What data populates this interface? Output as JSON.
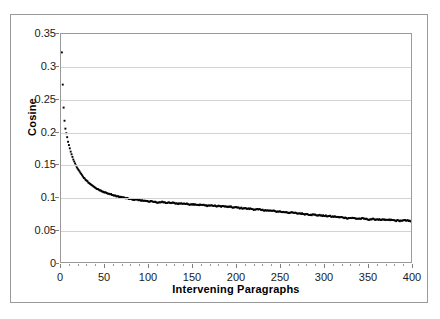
{
  "chart_data": {
    "type": "scatter",
    "title": "",
    "xlabel": "Intervening Paragraphs",
    "ylabel": "Cosine",
    "xlim": [
      0,
      400
    ],
    "ylim": [
      0,
      0.35
    ],
    "xticks": [
      0,
      50,
      100,
      150,
      200,
      250,
      300,
      350,
      400
    ],
    "xtick_labels": [
      "0",
      "50",
      "100",
      "150",
      "200",
      "250",
      "300",
      "350",
      "400"
    ],
    "yticks": [
      0,
      0.05,
      0.1,
      0.15,
      0.2,
      0.25,
      0.3,
      0.35
    ],
    "ytick_labels": [
      "0",
      "0.05",
      "0.1",
      "0.15",
      "0.2",
      "0.25",
      "0.3",
      "0.35"
    ],
    "grid": "horizontal",
    "legend": "none",
    "marker": "small-filled-diamond",
    "marker_color": "#000000",
    "series": [
      {
        "name": "Cosine similarity by intervening paragraph distance",
        "x": [
          1,
          2,
          3,
          4,
          5,
          6,
          7,
          8,
          9,
          10,
          11,
          12,
          13,
          14,
          15,
          16,
          17,
          18,
          19,
          20,
          21,
          22,
          23,
          24,
          25,
          26,
          27,
          28,
          29,
          30,
          31,
          32,
          33,
          34,
          35,
          36,
          37,
          38,
          39,
          40,
          41,
          42,
          43,
          44,
          45,
          46,
          47,
          48,
          49,
          50,
          52,
          54,
          56,
          58,
          60,
          62,
          64,
          66,
          68,
          70,
          72,
          74,
          76,
          78,
          80,
          82,
          84,
          86,
          88,
          90,
          92,
          94,
          96,
          98,
          100,
          104,
          108,
          112,
          116,
          120,
          124,
          128,
          132,
          136,
          140,
          144,
          148,
          152,
          156,
          160,
          164,
          168,
          172,
          176,
          180,
          184,
          188,
          192,
          196,
          200,
          204,
          208,
          212,
          216,
          220,
          224,
          228,
          232,
          236,
          240,
          244,
          248,
          252,
          256,
          260,
          264,
          268,
          272,
          276,
          280,
          284,
          288,
          292,
          296,
          300,
          304,
          308,
          312,
          316,
          320,
          324,
          328,
          332,
          336,
          340,
          344,
          348,
          352,
          356,
          360,
          364,
          368,
          372,
          376,
          380,
          384,
          388,
          392,
          396,
          400
        ],
        "y": [
          0.322,
          0.273,
          0.238,
          0.218,
          0.206,
          0.199,
          0.193,
          0.186,
          0.181,
          0.176,
          0.171,
          0.167,
          0.163,
          0.159,
          0.156,
          0.153,
          0.15,
          0.147,
          0.145,
          0.143,
          0.141,
          0.139,
          0.137,
          0.135,
          0.133,
          0.131,
          0.13,
          0.128,
          0.127,
          0.126,
          0.124,
          0.123,
          0.122,
          0.121,
          0.12,
          0.119,
          0.118,
          0.117,
          0.116,
          0.115,
          0.114,
          0.114,
          0.113,
          0.112,
          0.112,
          0.111,
          0.11,
          0.11,
          0.109,
          0.109,
          0.108,
          0.107,
          0.106,
          0.105,
          0.104,
          0.104,
          0.103,
          0.102,
          0.102,
          0.101,
          0.101,
          0.1,
          0.1,
          0.099,
          0.099,
          0.098,
          0.098,
          0.098,
          0.097,
          0.097,
          0.097,
          0.096,
          0.096,
          0.096,
          0.095,
          0.095,
          0.094,
          0.094,
          0.094,
          0.093,
          0.093,
          0.093,
          0.092,
          0.092,
          0.092,
          0.091,
          0.091,
          0.091,
          0.09,
          0.09,
          0.089,
          0.089,
          0.089,
          0.088,
          0.088,
          0.088,
          0.087,
          0.087,
          0.086,
          0.086,
          0.085,
          0.085,
          0.084,
          0.084,
          0.083,
          0.083,
          0.082,
          0.082,
          0.081,
          0.081,
          0.08,
          0.08,
          0.079,
          0.079,
          0.078,
          0.078,
          0.077,
          0.077,
          0.076,
          0.076,
          0.075,
          0.075,
          0.074,
          0.074,
          0.073,
          0.073,
          0.072,
          0.072,
          0.071,
          0.071,
          0.07,
          0.07,
          0.07,
          0.069,
          0.069,
          0.069,
          0.068,
          0.068,
          0.068,
          0.068,
          0.067,
          0.067,
          0.067,
          0.067,
          0.066,
          0.066,
          0.066,
          0.066,
          0.066,
          0.065
        ]
      }
    ]
  }
}
